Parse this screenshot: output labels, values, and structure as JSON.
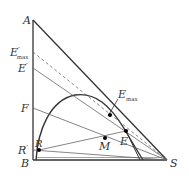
{
  "diagram": {
    "type": "ternary-extraction-right-triangle",
    "vertices": {
      "A": {
        "label": "A"
      },
      "B": {
        "label": "B"
      },
      "S": {
        "label": "S"
      }
    },
    "axis_points": {
      "E_max_prime": {
        "label": "E",
        "prime": "′",
        "sub": "max"
      },
      "E_prime": {
        "label": "E",
        "prime": "′"
      },
      "F": {
        "label": "F"
      },
      "R_prime": {
        "label": "R",
        "prime": "′"
      }
    },
    "curve_points": {
      "E_max": {
        "label": "E",
        "sub": "max"
      },
      "E": {
        "label": "E"
      },
      "M": {
        "label": "M"
      },
      "R": {
        "label": "R"
      }
    },
    "colors": {
      "line": "#333333",
      "thin_line": "#666666",
      "background": "#ffffff"
    }
  }
}
